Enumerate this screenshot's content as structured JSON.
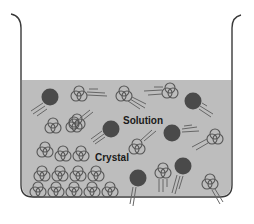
{
  "diagram": {
    "title": "",
    "labels": {
      "solution": "Solution",
      "crystal": "Crystal"
    },
    "colors": {
      "background": "#ffffff",
      "liquid": "#bdbdbd",
      "beaker_outline": "#3a3a3a",
      "solute_particle": "#4a4a4a",
      "molecule_outline": "#555555",
      "motion_lines": "#666666"
    },
    "legend": {
      "filled_circle": "solute particle (solvated ion)",
      "outlined_cluster": "molecule (solvent / crystal unit)"
    },
    "components": [
      "beaker",
      "liquid-solution",
      "crystal-lattice",
      "dissolved-particles",
      "free-molecules"
    ]
  }
}
